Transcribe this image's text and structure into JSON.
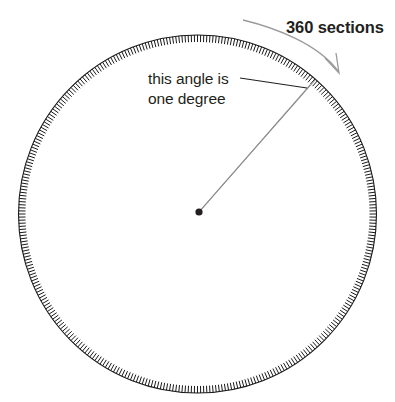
{
  "figure": {
    "background_color": "#ffffff"
  },
  "labels": {
    "sections": "360 sections",
    "angle_line1": "this angle is",
    "angle_line2": "one degree"
  },
  "colors": {
    "text": "#231f20",
    "rim": "#1a1a1a",
    "tick": "#1a1a1a",
    "wedge": "#8c8c8c",
    "sweep_arrow": "#9a9a9a",
    "center_dot": "#231f20"
  },
  "chart_data": {
    "type": "diagram",
    "shape": "circle",
    "tick_count": 360,
    "tick_length_px": 7,
    "circle": {
      "center_x": 197.5,
      "center_y": 214,
      "radius": 179
    },
    "angle_wedge_degrees": 1,
    "wedge_start_angle_deg": -49,
    "wedge_end_angle_deg": -50,
    "annotations": [
      {
        "text": "360 sections",
        "x": 286,
        "y": 33,
        "target": "tick-ring"
      },
      {
        "text": "this angle is one degree",
        "x": 148,
        "y": 84,
        "target": "one-degree-wedge"
      }
    ]
  }
}
